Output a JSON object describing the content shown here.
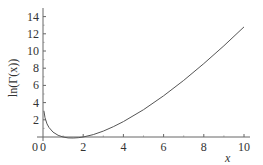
{
  "chart_data": {
    "type": "line",
    "title": "",
    "xlabel": "x",
    "ylabel": "ln(Γ(x))",
    "xlim": [
      0,
      10
    ],
    "ylim": [
      0,
      14
    ],
    "x_ticks": [
      "0",
      "2",
      "4",
      "6",
      "8",
      "10"
    ],
    "y_ticks": [
      "0",
      "2",
      "4",
      "6",
      "8",
      "10",
      "12",
      "14"
    ],
    "grid": false,
    "legend": null,
    "series": [
      {
        "name": "ln(Γ(x))",
        "x": [
          0.05,
          0.1,
          0.2,
          0.3,
          0.5,
          0.75,
          1,
          1.25,
          1.5,
          1.75,
          2,
          2.5,
          3,
          3.5,
          4,
          5,
          6,
          7,
          8,
          9,
          10
        ],
        "y": [
          2.99,
          2.25,
          1.52,
          1.1,
          0.57,
          0.2,
          0.0,
          -0.1,
          -0.12,
          -0.08,
          0.0,
          0.28,
          0.69,
          1.2,
          1.79,
          3.18,
          4.79,
          6.58,
          8.53,
          10.6,
          12.8
        ]
      }
    ]
  },
  "labels": {
    "x_axis": "x",
    "y_axis": "ln(Γ(x))"
  }
}
